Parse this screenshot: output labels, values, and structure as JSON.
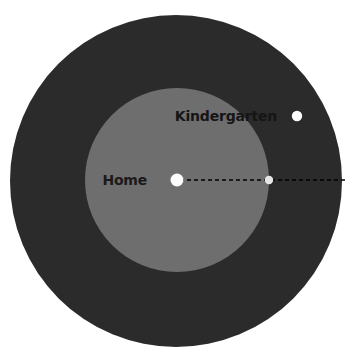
{
  "figure": {
    "background_color": "#ffffff",
    "width": 356,
    "height": 361
  },
  "chart_data": {
    "type": "scatter",
    "title": "",
    "subtitle": "",
    "xlabel": "",
    "ylabel": "",
    "grid": false,
    "legend_position": "none",
    "layers": [
      {
        "name": "outer-buffer",
        "shape": "circle",
        "label": "",
        "center": [
          176,
          181
        ],
        "radius": 166,
        "fill": "#2b2b2b",
        "stroke": "none"
      },
      {
        "name": "inner-buffer",
        "shape": "circle",
        "label": "",
        "center": [
          177,
          180
        ],
        "radius": 92,
        "fill": "#6e6e6e",
        "stroke": "none"
      }
    ],
    "points": [
      {
        "name": "home",
        "label": "Home",
        "x": 177,
        "y": 180,
        "radius": 6.5,
        "fill": "#fdfdfd",
        "label_color": "#1a1a1a",
        "label_x": 147,
        "label_y": 185,
        "label_anchor": "end",
        "label_size": 14
      },
      {
        "name": "radius-endpoint",
        "label": "",
        "x": 269,
        "y": 180,
        "radius": 4.2,
        "fill": "#e6e6e6",
        "label_color": "#1a1a1a",
        "label_x": 269,
        "label_y": 180,
        "label_anchor": "middle",
        "label_size": 14
      },
      {
        "name": "kindergarten",
        "label": "Kindergarten",
        "x": 297,
        "y": 116,
        "radius": 5.2,
        "fill": "#fdfdfd",
        "label_color": "#151515",
        "label_x": 277,
        "label_y": 121,
        "label_anchor": "end",
        "label_size": 14
      }
    ],
    "annotations": [
      {
        "name": "radius-line",
        "type": "dashed-line",
        "x1": 180,
        "y1": 180,
        "x2": 347,
        "y2": 180,
        "color": "#000000",
        "stroke_width": 1.6,
        "dash_pattern": "4 3"
      }
    ]
  },
  "labels": {
    "home": "Home",
    "kindergarten": "Kindergarten"
  },
  "colors": {
    "outer_circle": "#2b2b2b",
    "inner_circle": "#6e6e6e",
    "dot_white": "#fdfdfd",
    "dot_gray": "#e6e6e6",
    "line": "#000000",
    "label_dark": "#1a1a1a",
    "background": "#ffffff"
  }
}
